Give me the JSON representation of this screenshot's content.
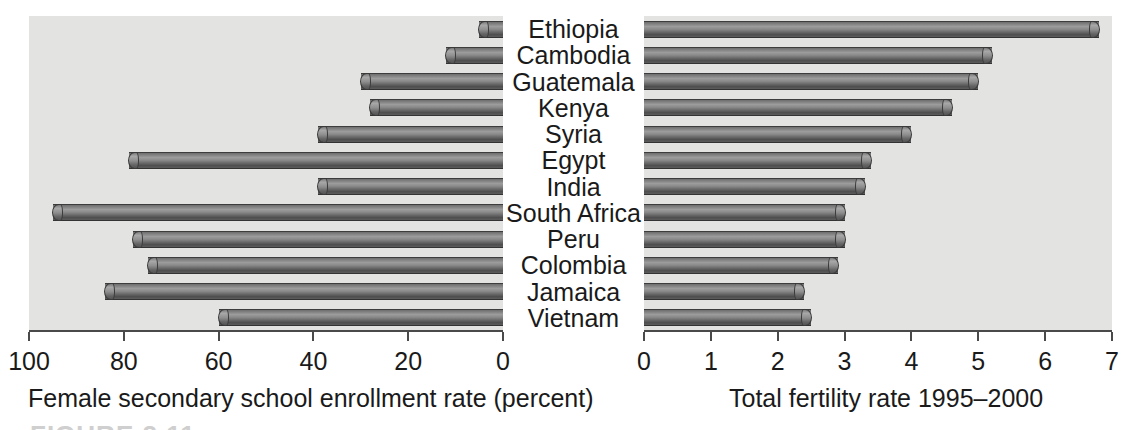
{
  "chart_data": {
    "type": "bar",
    "title": "",
    "orientation": "horizontal",
    "layout": "back-to-back paired horizontal bar charts sharing centred category labels",
    "categories": [
      "Ethiopia",
      "Cambodia",
      "Guatemala",
      "Kenya",
      "Syria",
      "Egypt",
      "India",
      "South Africa",
      "Peru",
      "Colombia",
      "Jamaica",
      "Vietnam"
    ],
    "panels": [
      {
        "id": "left",
        "xlabel": "Female secondary school enrollment rate (percent)",
        "direction": "right-to-left",
        "xlim": [
          100,
          0
        ],
        "ticks": [
          100,
          80,
          60,
          40,
          20,
          0
        ],
        "tick_labels": [
          "100",
          "80",
          "60",
          "40",
          "20",
          "0"
        ],
        "grid": false,
        "values": [
          5,
          12,
          30,
          28,
          39,
          79,
          39,
          95,
          78,
          75,
          84,
          60
        ]
      },
      {
        "id": "right",
        "xlabel": "Total fertility rate 1995–2000",
        "direction": "left-to-right",
        "xlim": [
          0,
          7
        ],
        "ticks": [
          0,
          1,
          2,
          3,
          4,
          5,
          6,
          7
        ],
        "tick_labels": [
          "0",
          "1",
          "2",
          "3",
          "4",
          "5",
          "6",
          "7"
        ],
        "grid": false,
        "values": [
          6.8,
          5.2,
          5.0,
          4.6,
          4.0,
          3.4,
          3.3,
          3.0,
          3.0,
          2.9,
          2.4,
          2.5
        ]
      }
    ],
    "legend": null,
    "colors": {
      "plot_background": "#e3e3e1",
      "bar_fill": "#7d7d7d",
      "bar_outline": "#3a3a3a",
      "axis": "#4a4a4a",
      "text": "#1a1a1a",
      "page_background": "#ffffff"
    }
  },
  "caption_fragment": "FIGURE 2.11"
}
